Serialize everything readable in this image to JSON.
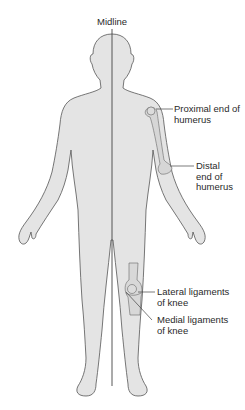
{
  "figure": {
    "midline_label": "Midline",
    "labels": {
      "proximal_humerus": "Proximal end of\nhumerus",
      "distal_humerus": "Distal\nend of\nhumerus",
      "lateral_ligaments": "Lateral ligaments\nof knee",
      "medial_ligaments": "Medial ligaments\nof knee"
    },
    "colors": {
      "body_fill": "#e4e4e4",
      "outline": "#555555",
      "bone_fill": "#d6d6d6",
      "text": "#2a2a2a"
    }
  }
}
